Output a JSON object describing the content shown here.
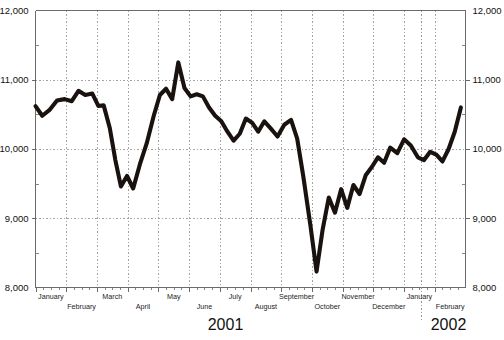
{
  "chart_data": {
    "type": "line",
    "title": "",
    "subtitle": "",
    "xlabel": "",
    "ylabel": "",
    "ylim": [
      8000,
      12000
    ],
    "y_ticks": [
      8000,
      9000,
      10000,
      11000,
      12000
    ],
    "y_tick_labels": [
      "8,000",
      "9,000",
      "10,000",
      "11,000",
      "12,000"
    ],
    "y_minor_step": 500,
    "grid": true,
    "grid_axes": "both",
    "legend": false,
    "legend_position": "none",
    "left_axis_labels": [
      "12,000",
      "11,000",
      "10,000",
      "9,000",
      "8,000"
    ],
    "right_axis_labels": [
      "12,000",
      "11,000",
      "10,000",
      "9,000",
      "8,000"
    ],
    "x_categories": [
      "January",
      "February",
      "March",
      "April",
      "May",
      "June",
      "July",
      "August",
      "September",
      "October",
      "November",
      "December",
      "January",
      "February"
    ],
    "x_group_labels": [
      "2001",
      "2002"
    ],
    "series": [
      {
        "name": "index",
        "x": [
          0.0,
          0.22,
          0.45,
          0.7,
          0.95,
          1.18,
          1.4,
          1.62,
          1.85,
          2.05,
          2.22,
          2.42,
          2.6,
          2.78,
          2.98,
          3.18,
          3.4,
          3.62,
          3.85,
          4.05,
          4.25,
          4.45,
          4.65,
          4.85,
          5.05,
          5.25,
          5.45,
          5.65,
          5.85,
          6.05,
          6.25,
          6.45,
          6.65,
          6.85,
          7.05,
          7.25,
          7.45,
          7.65,
          7.88,
          8.1,
          8.32,
          8.52,
          8.72,
          8.95,
          9.15,
          9.35,
          9.55,
          9.75,
          9.95,
          10.15,
          10.35,
          10.55,
          10.75,
          10.95,
          11.15,
          11.35,
          11.55,
          11.78,
          12.0,
          12.22,
          12.45,
          12.65,
          12.85,
          13.05,
          13.25,
          13.45,
          13.65,
          13.85
        ],
        "values": [
          10620,
          10480,
          10560,
          10700,
          10720,
          10690,
          10840,
          10780,
          10800,
          10620,
          10630,
          10300,
          9840,
          9460,
          9610,
          9430,
          9780,
          10080,
          10480,
          10780,
          10870,
          10720,
          11250,
          10880,
          10760,
          10790,
          10760,
          10600,
          10480,
          10400,
          10250,
          10120,
          10220,
          10440,
          10380,
          10250,
          10400,
          10300,
          10180,
          10350,
          10420,
          10150,
          9600,
          8900,
          8230,
          8840,
          9300,
          9080,
          9420,
          9150,
          9480,
          9350,
          9620,
          9740,
          9880,
          9800,
          10020,
          9940,
          10140,
          10050,
          9880,
          9840,
          9960,
          9920,
          9820,
          10000,
          10250,
          10600
        ]
      }
    ],
    "annotations": []
  },
  "axes": {
    "left": {
      "ticks": [
        "12,000",
        "11,000",
        "10,000",
        "9,000",
        "8,000"
      ]
    },
    "right": {
      "ticks": [
        "12,000",
        "11,000",
        "10,000",
        "9,000",
        "8,000"
      ]
    },
    "months": [
      {
        "label": "January",
        "row": 0
      },
      {
        "label": "February",
        "row": 1
      },
      {
        "label": "March",
        "row": 0
      },
      {
        "label": "April",
        "row": 1
      },
      {
        "label": "May",
        "row": 0
      },
      {
        "label": "June",
        "row": 1
      },
      {
        "label": "July",
        "row": 0
      },
      {
        "label": "August",
        "row": 1
      },
      {
        "label": "September",
        "row": 0
      },
      {
        "label": "October",
        "row": 1
      },
      {
        "label": "November",
        "row": 0
      },
      {
        "label": "December",
        "row": 1
      },
      {
        "label": "January",
        "row": 0
      },
      {
        "label": "February",
        "row": 1
      }
    ],
    "years": [
      {
        "label": "2001"
      },
      {
        "label": "2002"
      }
    ]
  },
  "colors": {
    "line": "#1a120e",
    "grid": "#9a9a9a",
    "axis": "#6b6b6b",
    "text": "#111111",
    "background": "#ffffff"
  }
}
